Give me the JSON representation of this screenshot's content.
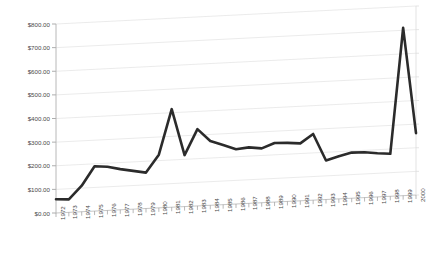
{
  "chart": {
    "title": "",
    "type_label": "3d-line-chart"
  },
  "chart_data": {
    "type": "line",
    "title": "",
    "subtitle": "",
    "xlabel": "",
    "ylabel": "",
    "ylim": [
      0,
      800
    ],
    "ytick_values": [
      0,
      100,
      200,
      300,
      400,
      500,
      600,
      700,
      800
    ],
    "ytick_labels": [
      "$0.00",
      "$100.00",
      "$200.00",
      "$300.00",
      "$400.00",
      "$500.00",
      "$600.00",
      "$700.00",
      "$800.00"
    ],
    "grid": true,
    "legend": "none",
    "three_d": true,
    "categories": [
      "1972",
      "1973",
      "1974",
      "1975",
      "1976",
      "1977",
      "1978",
      "1979",
      "1980",
      "1981",
      "1982",
      "1983",
      "1984",
      "1985",
      "1986",
      "1987",
      "1988",
      "1989",
      "1990",
      "1991",
      "1992",
      "1993",
      "1994",
      "1995",
      "1996",
      "1997",
      "1998",
      "1999",
      "2000"
    ],
    "series": [
      {
        "name": "Value",
        "color": "#2b2b2b",
        "values": [
          58,
          55,
          110,
          190,
          185,
          172,
          162,
          152,
          225,
          415,
          218,
          325,
          272,
          252,
          232,
          237,
          230,
          250,
          248,
          243,
          280,
          165,
          180,
          193,
          192,
          185,
          180,
          710,
          262
        ]
      }
    ]
  },
  "axes": {
    "y_axis_name": "currency-axis",
    "x_axis_name": "year-axis"
  }
}
